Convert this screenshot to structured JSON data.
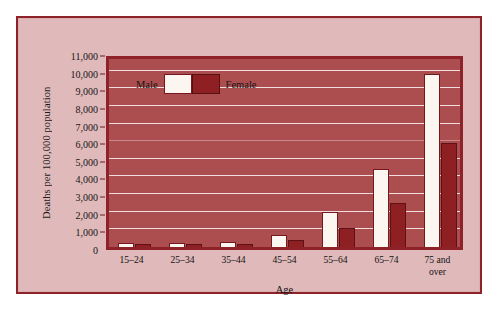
{
  "chart_data": {
    "type": "bar",
    "title": "",
    "xlabel": "Age",
    "ylabel": "Deaths per 100,000 population",
    "ylim": [
      0,
      11000
    ],
    "ytick_step": 1000,
    "grid": true,
    "legend_position": "top-left-inside",
    "categories": [
      "15–24",
      "25–34",
      "35–44",
      "45–54",
      "55–64",
      "65–74",
      "75 and\nover"
    ],
    "ytick_labels": [
      "0",
      "1,000",
      "2,000",
      "3,000",
      "4,000",
      "5,000",
      "6,000",
      "7,000",
      "8,000",
      "9,000",
      "10,000",
      "11,000"
    ],
    "ytick_values": [
      0,
      1000,
      2000,
      3000,
      4000,
      5000,
      6000,
      7000,
      8000,
      9000,
      10000,
      11000
    ],
    "series": [
      {
        "name": "Male",
        "color": "#fbf6ef",
        "values": [
          180,
          200,
          290,
          700,
          2000,
          4400,
          9800
        ]
      },
      {
        "name": "Female",
        "color": "#8e1f23",
        "values": [
          80,
          110,
          180,
          400,
          1100,
          2500,
          5900
        ]
      }
    ]
  },
  "legend": {
    "male_label": "Male",
    "female_label": "Female"
  },
  "colors": {
    "plot_background": "#ac4d4f",
    "figure_background": "#e0b9ba",
    "frame_border": "#8e2228",
    "gridline": "#f2dede",
    "male_bar": "#fbf6ef",
    "female_bar": "#8e1f23"
  }
}
